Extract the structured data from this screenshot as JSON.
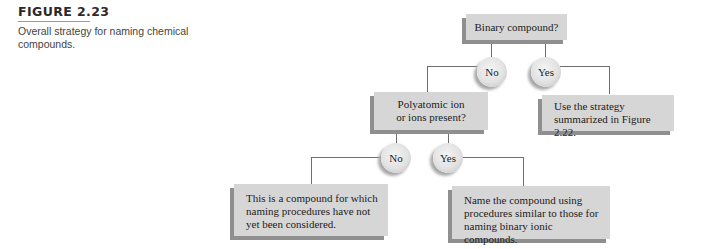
{
  "figure": {
    "label": "FIGURE 2.23",
    "caption": "Overall strategy for naming chemical compounds."
  },
  "flowchart": {
    "root_question": "Binary compound?",
    "root_no": "No",
    "root_yes": "Yes",
    "yes_outcome": "Use the strategy summarized in Figure 2.22.",
    "second_question_line1": "Polyatomic ion",
    "second_question_line2": "or ions present?",
    "second_no": "No",
    "second_yes": "Yes",
    "no_outcome": "This is a compound for which naming procedures have not yet been considered.",
    "yes_outcome_2": "Name the compound using procedures similar to those for naming binary ionic compounds."
  },
  "colors": {
    "box_fill": "#d6d6d6",
    "box_shadow": "#8f8f8f",
    "connector": "#6e6e6e"
  }
}
